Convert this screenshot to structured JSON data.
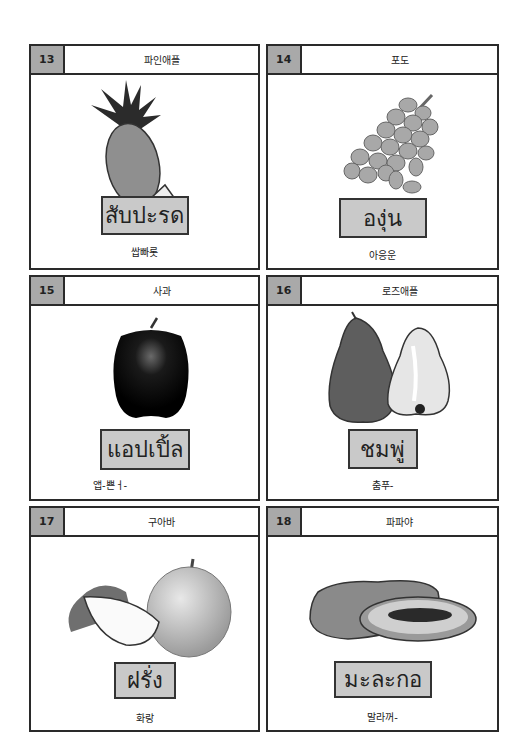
{
  "cards": [
    {
      "number": "13",
      "korean": "파인애플",
      "thai": "สับปะรด",
      "pronunciation": "쌉빠롯",
      "illustration": "pineapple"
    },
    {
      "number": "14",
      "korean": "포도",
      "thai": "องุ่น",
      "pronunciation": "아응운",
      "illustration": "grapes"
    },
    {
      "number": "15",
      "korean": "사과",
      "thai": "แอปเปิ้ล",
      "pronunciation": "앱-쁜ㅓ-",
      "illustration": "apple"
    },
    {
      "number": "16",
      "korean": "로즈애플",
      "thai": "ชมพู่",
      "pronunciation": "춤푸-",
      "illustration": "rose-apple"
    },
    {
      "number": "17",
      "korean": "구아바",
      "thai": "ฝรั่ง",
      "pronunciation": "화랑",
      "illustration": "guava"
    },
    {
      "number": "18",
      "korean": "파파야",
      "thai": "มะละกอ",
      "pronunciation": "말라꺼-",
      "illustration": "papaya"
    }
  ],
  "colors": {
    "border": "#2a2a2a",
    "number_box": "#a9a9a9",
    "label_box": "#c9c9c9"
  }
}
